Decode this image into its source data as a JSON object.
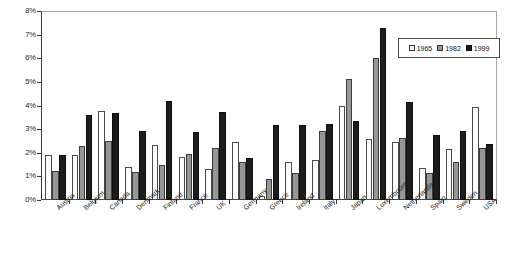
{
  "chart_data": {
    "type": "bar",
    "title": "",
    "subtitle": "",
    "xlabel": "",
    "ylabel": "",
    "ylim": [
      0,
      8
    ],
    "ytick_labels": [
      "0%",
      "1%",
      "2%",
      "3%",
      "4%",
      "5%",
      "6%",
      "7%",
      "8%"
    ],
    "ytick_values": [
      0,
      1,
      2,
      3,
      4,
      5,
      6,
      7,
      8
    ],
    "grid": true,
    "legend_position": "top-right",
    "categories": [
      "Austria",
      "Belgium",
      "Canada",
      "Denmark",
      "Finland",
      "France",
      "UK",
      "Germany",
      "Greece",
      "Ireland",
      "Italy",
      "Japan",
      "Luxembourg",
      "Netherlands",
      "Spain",
      "Sweden",
      "USA"
    ],
    "series": [
      {
        "name": "1965",
        "color": "#ffffff",
        "values": [
          1.9,
          1.9,
          3.8,
          1.4,
          2.35,
          1.85,
          1.3,
          2.45,
          0.15,
          1.6,
          1.7,
          4.0,
          2.6,
          2.45,
          1.35,
          2.15,
          3.95
        ]
      },
      {
        "name": "1982",
        "color": "#969696",
        "values": [
          1.25,
          2.3,
          2.5,
          1.2,
          1.5,
          1.95,
          2.2,
          1.6,
          0.9,
          1.15,
          2.95,
          5.15,
          6.05,
          2.65,
          1.15,
          1.6,
          2.2
        ]
      },
      {
        "name": "1999",
        "color": "#1c1c1c",
        "values": [
          1.9,
          3.6,
          3.7,
          2.95,
          4.2,
          2.9,
          3.75,
          1.8,
          3.2,
          3.2,
          3.25,
          3.35,
          7.3,
          4.15,
          2.75,
          2.95,
          2.4
        ]
      }
    ]
  }
}
